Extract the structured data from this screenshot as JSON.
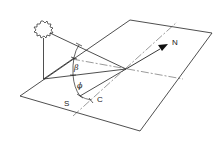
{
  "diagram": {
    "labels": {
      "north": "N",
      "south": "S",
      "c": "C",
      "beta": "β",
      "phi": "ϕ"
    },
    "elements": [
      "sun",
      "horizontal-plane",
      "north-arrow",
      "altitude-angle",
      "azimuth-angle"
    ],
    "colors": {
      "stroke": "#222222",
      "background": "#ffffff"
    }
  }
}
